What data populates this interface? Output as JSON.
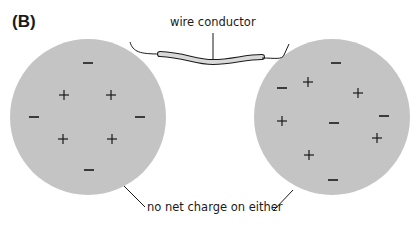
{
  "figure": {
    "panel_label": "(B)",
    "wire_label": "wire conductor",
    "charge_label": "no net charge on either",
    "colors": {
      "sphere_fill": "#c4c4c4",
      "wire_fill": "#d9d9d9",
      "ink": "#1a1a1a"
    },
    "spheres": [
      {
        "name": "left",
        "cx": 88,
        "cy": 117,
        "r": 78,
        "charges": [
          {
            "sign": "-",
            "x": 88,
            "y": 63
          },
          {
            "sign": "+",
            "x": 64,
            "y": 95
          },
          {
            "sign": "+",
            "x": 111,
            "y": 95
          },
          {
            "sign": "-",
            "x": 34,
            "y": 117
          },
          {
            "sign": "-",
            "x": 140,
            "y": 117
          },
          {
            "sign": "+",
            "x": 63,
            "y": 139
          },
          {
            "sign": "+",
            "x": 112,
            "y": 139
          },
          {
            "sign": "-",
            "x": 89,
            "y": 170
          }
        ]
      },
      {
        "name": "right",
        "cx": 332,
        "cy": 117,
        "r": 78,
        "charges": [
          {
            "sign": "-",
            "x": 336,
            "y": 63
          },
          {
            "sign": "+",
            "x": 308,
            "y": 82
          },
          {
            "sign": "-",
            "x": 282,
            "y": 88
          },
          {
            "sign": "+",
            "x": 358,
            "y": 93
          },
          {
            "sign": "-",
            "x": 384,
            "y": 116
          },
          {
            "sign": "+",
            "x": 282,
            "y": 121
          },
          {
            "sign": "-",
            "x": 334,
            "y": 123
          },
          {
            "sign": "+",
            "x": 377,
            "y": 138
          },
          {
            "sign": "+",
            "x": 309,
            "y": 155
          },
          {
            "sign": "-",
            "x": 333,
            "y": 180
          }
        ]
      }
    ]
  }
}
